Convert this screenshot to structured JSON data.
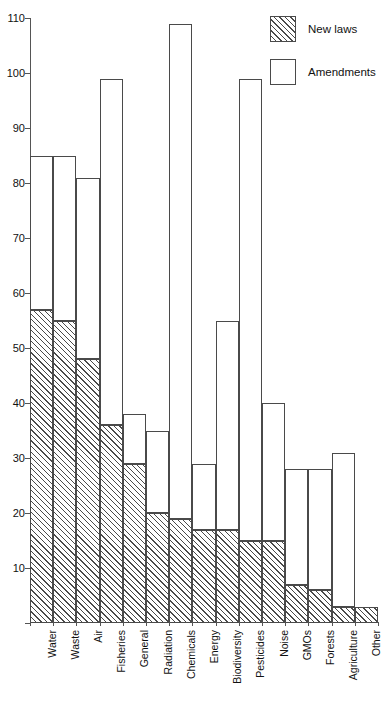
{
  "chart_data": {
    "type": "bar",
    "subtype": "stacked-vertical",
    "title": "",
    "subtitle": "",
    "xlabel": "",
    "ylabel": "",
    "ylim": [
      0,
      110
    ],
    "y_ticks": [
      0,
      10,
      20,
      30,
      40,
      50,
      60,
      70,
      80,
      90,
      100,
      110
    ],
    "y_tick_labels": [
      "0",
      "10",
      "20",
      "30",
      "40",
      "50",
      "60",
      "70",
      "80",
      "90",
      "100",
      "110"
    ],
    "grid": false,
    "legend_position": "top-right",
    "categories": [
      "Water",
      "Waste",
      "Air",
      "Fisheries",
      "General",
      "Radiation",
      "Chemicals",
      "Energy",
      "Biodiversity",
      "Pesticides",
      "Noise",
      "GMOs",
      "Forests",
      "Agriculture",
      "Other"
    ],
    "series": [
      {
        "name": "New laws",
        "fill": "hatched",
        "color": "#ffffff",
        "edge_color": "#4a4a4a",
        "values": [
          57,
          55,
          48,
          36,
          29,
          20,
          19,
          17,
          17,
          15,
          15,
          7,
          6,
          3,
          3
        ]
      },
      {
        "name": "Amendments",
        "fill": "empty",
        "color": "#ffffff",
        "edge_color": "#4a4a4a",
        "values": [
          28,
          30,
          33,
          63,
          9,
          15,
          90,
          12,
          38,
          84,
          25,
          21,
          22,
          28,
          0
        ]
      }
    ],
    "totals": [
      85,
      85,
      81,
      99,
      38,
      35,
      109,
      29,
      55,
      99,
      40,
      28,
      28,
      31,
      3
    ]
  },
  "legend": {
    "items": [
      {
        "label": "New laws",
        "swatch": "hatched-square-icon"
      },
      {
        "label": "Amendments",
        "swatch": "empty-square-icon"
      }
    ]
  },
  "axes": {
    "y_axis_name": "y-axis",
    "x_axis_name": "x-axis"
  }
}
